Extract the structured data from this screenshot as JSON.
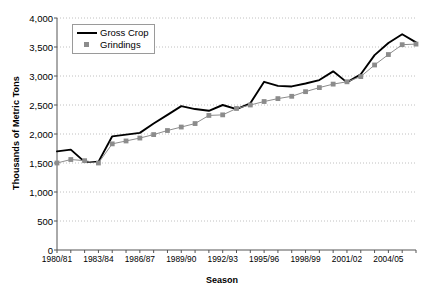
{
  "chart_data": {
    "type": "line",
    "title": "",
    "xlabel": "Season",
    "ylabel": "Thousands of Metric Tons",
    "ylim": [
      0,
      4000
    ],
    "ytick_values": [
      0,
      500,
      1000,
      1500,
      2000,
      2500,
      3000,
      3500,
      4000
    ],
    "ytick_labels": [
      "0",
      "500",
      "1,000",
      "1,500",
      "2,000",
      "2,500",
      "3,000",
      "3,500",
      "4,000"
    ],
    "grid": true,
    "legend_position": "upper-left-inside",
    "categories": [
      "1980/81",
      "1981/82",
      "1982/83",
      "1983/84",
      "1984/85",
      "1985/86",
      "1986/87",
      "1987/88",
      "1988/89",
      "1989/90",
      "1990/91",
      "1991/92",
      "1992/93",
      "1993/94",
      "1994/95",
      "1995/96",
      "1996/97",
      "1997/98",
      "1998/99",
      "1999/00",
      "2000/01",
      "2001/02",
      "2002/03",
      "2003/04",
      "2004/05",
      "2005/06",
      "2006/07"
    ],
    "xtick_labels": [
      "1980/81",
      "1983/84",
      "1986/87",
      "1989/90",
      "1992/93",
      "1995/96",
      "1998/99",
      "2001/02",
      "2004/05"
    ],
    "xtick_indices": [
      0,
      3,
      6,
      9,
      12,
      15,
      18,
      21,
      24
    ],
    "series": [
      {
        "name": "Gross Crop",
        "color": "#000000",
        "marker": "none",
        "values": [
          1700,
          1730,
          1520,
          1520,
          1960,
          1990,
          2020,
          2180,
          2330,
          2480,
          2430,
          2400,
          2500,
          2430,
          2530,
          2900,
          2830,
          2820,
          2870,
          2930,
          3080,
          2890,
          3030,
          3360,
          3570,
          3720,
          3580
        ]
      },
      {
        "name": "Grindings",
        "color": "#8c8c8c",
        "marker": "square",
        "values": [
          1500,
          1560,
          1540,
          1500,
          1830,
          1880,
          1930,
          1990,
          2060,
          2120,
          2180,
          2320,
          2330,
          2440,
          2500,
          2560,
          2610,
          2650,
          2730,
          2800,
          2860,
          2900,
          2990,
          3190,
          3370,
          3540,
          3550
        ]
      }
    ]
  },
  "legend": {
    "items": [
      {
        "label": "Gross Crop",
        "key": "line"
      },
      {
        "label": "Grindings",
        "key": "square"
      }
    ]
  }
}
